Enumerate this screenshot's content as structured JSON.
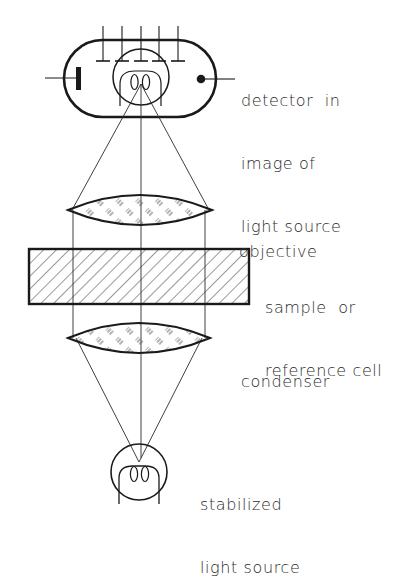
{
  "diagram": {
    "ink_color": "#1a1a1a",
    "background": "#ffffff",
    "components": [
      {
        "id": "detector",
        "label_lines": [
          "detector  in",
          "image of",
          "light source"
        ]
      },
      {
        "id": "objective",
        "label_lines": [
          "objective"
        ]
      },
      {
        "id": "sample",
        "label_lines": [
          "sample  or",
          "reference cell"
        ]
      },
      {
        "id": "condenser",
        "label_lines": [
          "condenser"
        ]
      },
      {
        "id": "light_source",
        "label_lines": [
          "stabilized",
          "light source"
        ]
      }
    ]
  }
}
